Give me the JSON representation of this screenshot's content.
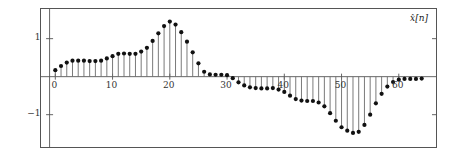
{
  "figure": {
    "width": 453,
    "height": 161,
    "background": "#ffffff",
    "frame_color": "#555555"
  },
  "axes": {
    "series_label": "x[n]",
    "series_label_base": "x",
    "series_label_index": "[n]",
    "y_ticks": [
      {
        "value": 1,
        "label": "1"
      },
      {
        "value": -1,
        "label": "-1"
      }
    ],
    "x_ticks": [
      {
        "value": 0,
        "label": "0"
      },
      {
        "value": 10,
        "label": "10"
      },
      {
        "value": 20,
        "label": "20"
      },
      {
        "value": 30,
        "label": "30"
      },
      {
        "value": 40,
        "label": "40"
      },
      {
        "value": 50,
        "label": "50"
      },
      {
        "value": 60,
        "label": "60"
      }
    ],
    "xlim": [
      -2.5,
      66.5
    ],
    "ylim": [
      -1.85,
      1.78
    ],
    "zero_line": true,
    "grid": false
  },
  "style": {
    "stem_color": "#6b6b6b",
    "marker_color": "#111111",
    "marker_radius": 2.1,
    "stem_width": 0.9,
    "axis_color": "#555555",
    "tick_color": "#555555"
  },
  "chart_data": {
    "type": "scatter",
    "plot_style": "stem",
    "title": "",
    "xlabel": "",
    "ylabel": "",
    "series_name": "x-hat[n]",
    "xlim": [
      -2.5,
      66.5
    ],
    "ylim": [
      -1.85,
      1.78
    ],
    "grid": false,
    "legend": "none",
    "annotations": [
      {
        "text": "x[n]",
        "position": "top-right"
      }
    ],
    "x": [
      0,
      1,
      2,
      3,
      4,
      5,
      6,
      7,
      8,
      9,
      10,
      11,
      12,
      13,
      14,
      15,
      16,
      17,
      18,
      19,
      20,
      21,
      22,
      23,
      24,
      25,
      26,
      27,
      28,
      29,
      30,
      31,
      32,
      33,
      34,
      35,
      36,
      37,
      38,
      39,
      40,
      41,
      42,
      43,
      44,
      45,
      46,
      47,
      48,
      49,
      50,
      51,
      52,
      53,
      54,
      55,
      56,
      57,
      58,
      59,
      60,
      61,
      62,
      63,
      64
    ],
    "values": [
      0.17,
      0.28,
      0.37,
      0.42,
      0.42,
      0.42,
      0.41,
      0.41,
      0.42,
      0.48,
      0.54,
      0.6,
      0.61,
      0.6,
      0.6,
      0.66,
      0.76,
      0.94,
      1.14,
      1.33,
      1.45,
      1.37,
      1.17,
      0.92,
      0.64,
      0.35,
      0.13,
      0.06,
      0.05,
      0.05,
      0.04,
      -0.04,
      -0.15,
      -0.23,
      -0.28,
      -0.3,
      -0.31,
      -0.31,
      -0.3,
      -0.34,
      -0.4,
      -0.5,
      -0.59,
      -0.63,
      -0.64,
      -0.64,
      -0.68,
      -0.78,
      -0.96,
      -1.16,
      -1.33,
      -1.42,
      -1.48,
      -1.45,
      -1.27,
      -1.0,
      -0.7,
      -0.45,
      -0.26,
      -0.14,
      -0.08,
      -0.06,
      -0.06,
      -0.06,
      -0.05
    ]
  }
}
